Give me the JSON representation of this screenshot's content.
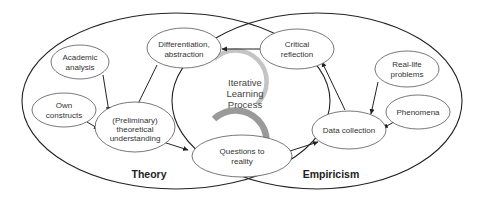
{
  "diagram": {
    "regions": {
      "theory": {
        "label": "Theory"
      },
      "empiricism": {
        "label": "Empiricism"
      }
    },
    "center": {
      "lines": [
        "Iterative",
        "Learning",
        "Process"
      ],
      "icon": "circular-arrow-icon",
      "arrow_color": "#b5b5b5"
    },
    "nodes": {
      "academic_analysis": {
        "lines": [
          "Academic",
          "analysis"
        ]
      },
      "own_constructs": {
        "lines": [
          "Own",
          "constructs"
        ]
      },
      "theoretical_understanding": {
        "lines": [
          "(Preliminary)",
          "theoretical",
          "understanding"
        ]
      },
      "differentiation": {
        "lines": [
          "Differentiation,",
          "abstraction"
        ]
      },
      "critical_reflection": {
        "lines": [
          "Critical",
          "reflection"
        ]
      },
      "real_life_problems": {
        "lines": [
          "Real-life",
          "problems"
        ]
      },
      "phenomena": {
        "lines": [
          "Phenomena"
        ]
      },
      "data_collection": {
        "lines": [
          "Data collection"
        ]
      },
      "questions_to_reality": {
        "lines": [
          "Questions to",
          "reality"
        ]
      }
    },
    "edges": [
      {
        "from": "Academic analysis",
        "to": "(Preliminary) theoretical understanding"
      },
      {
        "from": "Own constructs",
        "to": "(Preliminary) theoretical understanding"
      },
      {
        "from": "Differentiation, abstraction",
        "to": "(Preliminary) theoretical understanding"
      },
      {
        "from": "(Preliminary) theoretical understanding",
        "to": "Questions to reality"
      },
      {
        "from": "Questions to reality",
        "to": "Data collection"
      },
      {
        "from": "Real-life problems",
        "to": "Data collection"
      },
      {
        "from": "Phenomena",
        "to": "Data collection"
      },
      {
        "from": "Data collection",
        "to": "Critical reflection"
      },
      {
        "from": "Critical reflection",
        "to": "Differentiation, abstraction"
      }
    ],
    "colors": {
      "outline": "#222222",
      "node_stroke": "#555555",
      "text": "#333333",
      "cycle_arrow": "#b5b5b5"
    }
  }
}
